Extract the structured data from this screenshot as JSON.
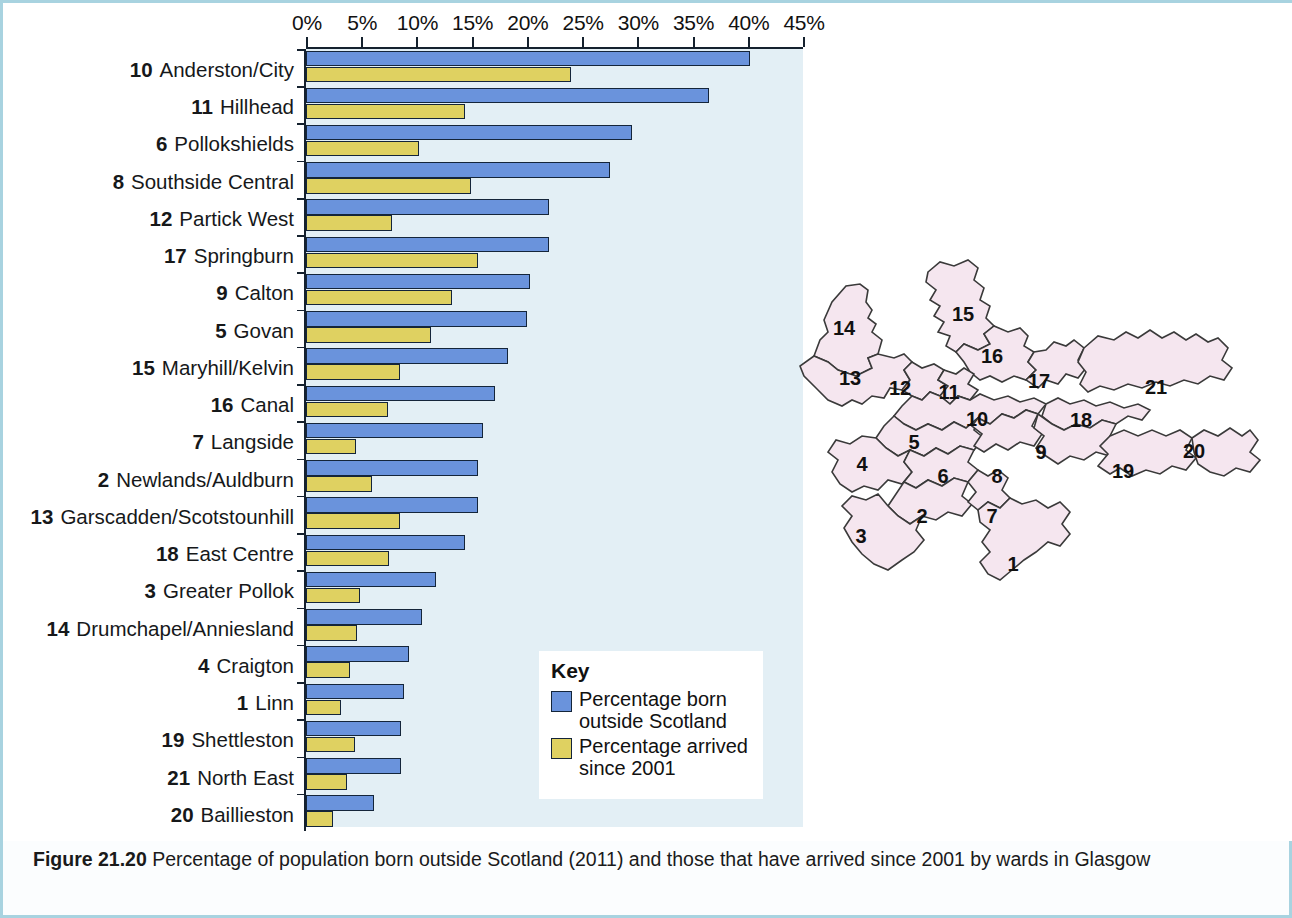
{
  "figure": {
    "label": "Figure 21.20",
    "caption": "Percentage of population born outside Scotland (2011) and those that have arrived since 2001 by wards in Glasgow"
  },
  "key": {
    "title": "Key",
    "items": [
      {
        "color": "#6a93dc",
        "label": "Percentage born outside Scotland"
      },
      {
        "color": "#dfd161",
        "label": "Percentage arrived since 2001"
      }
    ]
  },
  "axis": {
    "ticks": [
      "0%",
      "5%",
      "10%",
      "15%",
      "20%",
      "25%",
      "30%",
      "35%",
      "40%",
      "45%"
    ],
    "min": 0,
    "max": 45
  },
  "map": {
    "name": "glasgow-wards-map",
    "fill": "#f5e6ef",
    "stroke": "#3a3a3a",
    "ward_numbers": [
      "1",
      "2",
      "3",
      "4",
      "5",
      "6",
      "7",
      "8",
      "9",
      "10",
      "11",
      "12",
      "13",
      "14",
      "15",
      "16",
      "17",
      "18",
      "19",
      "20",
      "21"
    ]
  },
  "chart_data": {
    "type": "bar",
    "orientation": "horizontal",
    "title": "Percentage of population born outside Scotland (2011) and those that have arrived since 2001 by wards in Glasgow",
    "xlabel": "",
    "ylabel": "",
    "xlim": [
      0,
      45
    ],
    "grid": false,
    "legend_position": "inside-bottom-right",
    "categories": [
      "10  Anderston/City",
      "11  Hillhead",
      "6  Pollokshields",
      "8  Southside Central",
      "12  Partick West",
      "17  Springburn",
      "9  Calton",
      "5  Govan",
      "15  Maryhill/Kelvin",
      "16  Canal",
      "7  Langside",
      "2  Newlands/Auldburn",
      "13  Garscadden/Scotstounhill",
      "18  East Centre",
      "3  Greater Pollok",
      "14  Drumchapel/Anniesland",
      "4  Craigton",
      "1  Linn",
      "19  Shettleston",
      "21  North East",
      "20  Baillieston"
    ],
    "rows": [
      {
        "ward": "10",
        "name": "Anderston/City",
        "born_outside": 40.2,
        "arrived_since_2001": 24.0
      },
      {
        "ward": "11",
        "name": "Hillhead",
        "born_outside": 36.5,
        "arrived_since_2001": 14.4
      },
      {
        "ward": "6",
        "name": "Pollokshields",
        "born_outside": 29.5,
        "arrived_since_2001": 10.2
      },
      {
        "ward": "8",
        "name": "Southside Central",
        "born_outside": 27.5,
        "arrived_since_2001": 14.9
      },
      {
        "ward": "12",
        "name": "Partick West",
        "born_outside": 22.0,
        "arrived_since_2001": 7.8
      },
      {
        "ward": "17",
        "name": "Springburn",
        "born_outside": 22.0,
        "arrived_since_2001": 15.6
      },
      {
        "ward": "9",
        "name": "Calton",
        "born_outside": 20.3,
        "arrived_since_2001": 13.2
      },
      {
        "ward": "5",
        "name": "Govan",
        "born_outside": 20.0,
        "arrived_since_2001": 11.3
      },
      {
        "ward": "15",
        "name": "Maryhill/Kelvin",
        "born_outside": 18.3,
        "arrived_since_2001": 8.5
      },
      {
        "ward": "16",
        "name": "Canal",
        "born_outside": 17.1,
        "arrived_since_2001": 7.4
      },
      {
        "ward": "7",
        "name": "Langside",
        "born_outside": 16.0,
        "arrived_since_2001": 4.5
      },
      {
        "ward": "2",
        "name": "Newlands/Auldburn",
        "born_outside": 15.6,
        "arrived_since_2001": 6.0
      },
      {
        "ward": "13",
        "name": "Garscadden/Scotstounhill",
        "born_outside": 15.6,
        "arrived_since_2001": 8.5
      },
      {
        "ward": "18",
        "name": "East Centre",
        "born_outside": 14.4,
        "arrived_since_2001": 7.5
      },
      {
        "ward": "3",
        "name": "Greater Pollok",
        "born_outside": 11.8,
        "arrived_since_2001": 4.9
      },
      {
        "ward": "14",
        "name": "Drumchapel/Anniesland",
        "born_outside": 10.5,
        "arrived_since_2001": 4.6
      },
      {
        "ward": "4",
        "name": "Craigton",
        "born_outside": 9.3,
        "arrived_since_2001": 4.0
      },
      {
        "ward": "1",
        "name": "Linn",
        "born_outside": 8.9,
        "arrived_since_2001": 3.2
      },
      {
        "ward": "19",
        "name": "Shettleston",
        "born_outside": 8.6,
        "arrived_since_2001": 4.4
      },
      {
        "ward": "21",
        "name": "North East",
        "born_outside": 8.6,
        "arrived_since_2001": 3.7
      },
      {
        "ward": "20",
        "name": "Baillieston",
        "born_outside": 6.2,
        "arrived_since_2001": 2.4
      }
    ],
    "series": [
      {
        "name": "Percentage born outside Scotland",
        "color": "#6a93dc",
        "values": [
          40.2,
          36.5,
          29.5,
          27.5,
          22.0,
          22.0,
          20.3,
          20.0,
          18.3,
          17.1,
          16.0,
          15.6,
          15.6,
          14.4,
          11.8,
          10.5,
          9.3,
          8.9,
          8.6,
          8.6,
          6.2
        ]
      },
      {
        "name": "Percentage arrived since 2001",
        "color": "#dfd161",
        "values": [
          24.0,
          14.4,
          10.2,
          14.9,
          7.8,
          15.6,
          13.2,
          11.3,
          8.5,
          7.4,
          4.5,
          6.0,
          8.5,
          7.5,
          4.9,
          4.6,
          4.0,
          3.2,
          4.4,
          3.7,
          2.4
        ]
      }
    ]
  }
}
